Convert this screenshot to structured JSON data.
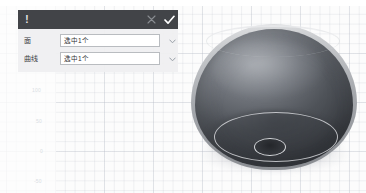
{
  "app": {
    "background_color": "#fcfcfc",
    "grid_line_color": "#bec3cd"
  },
  "axis_labels": [
    {
      "text": "100",
      "x": 32,
      "y": 87
    },
    {
      "text": "50",
      "x": 36,
      "y": 118
    },
    {
      "text": "0",
      "x": 40,
      "y": 148
    },
    {
      "text": "-50",
      "x": 34,
      "y": 178
    }
  ],
  "dialog": {
    "header": {
      "alert_glyph": "!",
      "title": "",
      "close_label": "×",
      "confirm_label": "✓",
      "background_color": "#424448",
      "confirm_color": "#ffffff",
      "close_color": "#8a8d92"
    },
    "rows": [
      {
        "label": "面",
        "value": "选中1个",
        "placeholder": "选择面",
        "chevron": "chevron-down-icon"
      },
      {
        "label": "曲线",
        "value": "选中1个",
        "placeholder": "选择曲线",
        "chevron": "chevron-down-icon"
      }
    ]
  },
  "model": {
    "name": "dome-solid",
    "body_color": "#54575d",
    "rim_color": "#c9cbce",
    "curve_color": "#dee0e4",
    "hole_color": "#24262a"
  }
}
